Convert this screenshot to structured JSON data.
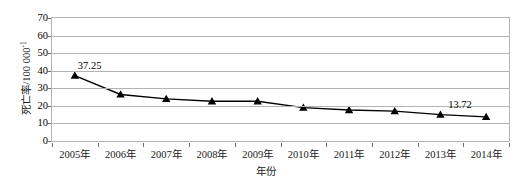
{
  "chart_data": {
    "type": "line",
    "title": "",
    "xlabel": "年份",
    "ylabel": "死亡率/100 000",
    "ylabel_main": "死亡率/100 000",
    "ylabel_sup": "-1",
    "categories": [
      "2005年",
      "2006年",
      "2007年",
      "2008年",
      "2009年",
      "2010年",
      "2011年",
      "2012年",
      "2013年",
      "2014年"
    ],
    "values": [
      37.25,
      26.5,
      24.0,
      22.6,
      22.6,
      19.0,
      17.6,
      17.0,
      15.0,
      13.72
    ],
    "ylim": [
      0,
      70
    ],
    "ytick_labels": [
      "0",
      "10",
      "20",
      "30",
      "40",
      "50",
      "60",
      "70"
    ],
    "ytick_values": [
      0,
      10,
      20,
      30,
      40,
      50,
      60,
      70
    ],
    "grid": true,
    "legend": "none",
    "marker": "triangle",
    "line_color": "#000000",
    "grid_color": "#b4b4b4",
    "annotations": [
      {
        "text": "37.25",
        "x_index": 0,
        "value": 37.25
      },
      {
        "text": "13.72",
        "x_index": 9,
        "value": 13.72
      }
    ]
  }
}
